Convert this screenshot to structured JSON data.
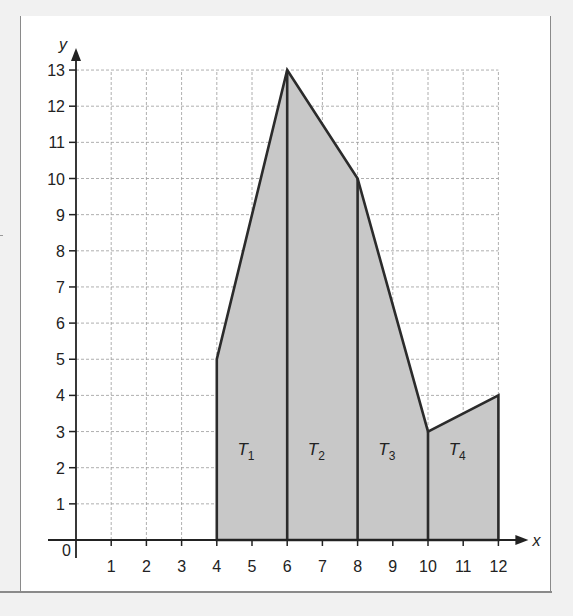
{
  "chart_data": {
    "type": "area",
    "title": "",
    "xlabel": "x",
    "ylabel": "y",
    "xlim": [
      0,
      12
    ],
    "ylim": [
      0,
      13
    ],
    "grid": true,
    "grid_style": "dashed",
    "origin_label": "0",
    "x_ticks": [
      "1",
      "2",
      "3",
      "4",
      "5",
      "6",
      "7",
      "8",
      "9",
      "10",
      "11",
      "12"
    ],
    "y_ticks": [
      "1",
      "2",
      "3",
      "4",
      "5",
      "6",
      "7",
      "8",
      "9",
      "10",
      "11",
      "12",
      "13"
    ],
    "polygon": [
      {
        "x": 4,
        "y": 0
      },
      {
        "x": 4,
        "y": 5
      },
      {
        "x": 6,
        "y": 13
      },
      {
        "x": 8,
        "y": 10
      },
      {
        "x": 10,
        "y": 3
      },
      {
        "x": 12,
        "y": 4
      },
      {
        "x": 12,
        "y": 0
      }
    ],
    "dividers_x": [
      6,
      8,
      10
    ],
    "regions": [
      {
        "name": "T",
        "sub": "1",
        "x_from": 4,
        "x_to": 6,
        "y_left": 5,
        "y_right": 13
      },
      {
        "name": "T",
        "sub": "2",
        "x_from": 6,
        "x_to": 8,
        "y_left": 13,
        "y_right": 10
      },
      {
        "name": "T",
        "sub": "3",
        "x_from": 8,
        "x_to": 10,
        "y_left": 10,
        "y_right": 3
      },
      {
        "name": "T",
        "sub": "4",
        "x_from": 10,
        "x_to": 12,
        "y_left": 3,
        "y_right": 4
      }
    ],
    "fill_color": "#c8c8c8",
    "line_color": "#2b2b2b",
    "grid_color": "#9a9a9a"
  }
}
